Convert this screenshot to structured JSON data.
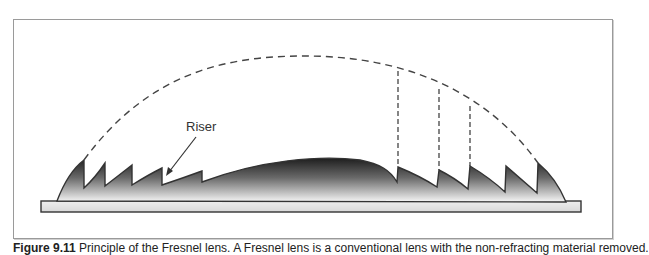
{
  "figure": {
    "labels": {
      "riser": "Riser"
    },
    "caption": {
      "number": "Figure 9.11",
      "text": "Principle of the Fresnel lens. A Fresnel lens is a conventional lens with the non-refracting material removed."
    },
    "colors": {
      "frame": "#9a9a9a",
      "outline": "#333333",
      "fill_dark": "#2a2a2a",
      "fill_light": "#f4f4f4",
      "dashed": "#444444"
    },
    "elements": {
      "dashed_arc": "original-lens-profile",
      "vertical_dashed_lines": 3,
      "left_teeth": 5,
      "right_teeth": 5,
      "center_lens": "central-convex-section",
      "base_plate": "lens-base"
    }
  }
}
